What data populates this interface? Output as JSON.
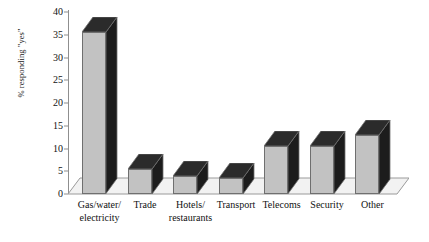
{
  "chart_data": {
    "type": "bar",
    "title": "",
    "subtitle": "",
    "xlabel": "",
    "ylabel": "% responding \"yes\"",
    "categories": [
      "Gas/water/ electricity",
      "Trade",
      "Hotels/ restaurants",
      "Transport",
      "Telecoms",
      "Security",
      "Other"
    ],
    "category_lines": [
      [
        "Gas/water/",
        "electricity"
      ],
      [
        "Trade"
      ],
      [
        "Hotels/",
        "restaurants"
      ],
      [
        "Transport"
      ],
      [
        "Telecoms"
      ],
      [
        "Security"
      ],
      [
        "Other"
      ]
    ],
    "values": [
      35.5,
      5.5,
      4,
      3.5,
      10.5,
      10.5,
      13
    ],
    "ylim": [
      0,
      40
    ],
    "yticks": [
      0,
      5,
      10,
      15,
      20,
      25,
      30,
      35,
      40
    ],
    "ytick_labels": [
      "0",
      "5",
      "10",
      "15",
      "20",
      "25",
      "30",
      "35",
      "40"
    ],
    "grid": false,
    "legend": null,
    "legend_position": "none",
    "style": "3d-column",
    "colors": {
      "bar_front": "#c2c2c2",
      "bar_side": "#1c1c1c",
      "bar_top": "#2b2b2b",
      "bar_outline": "#6f6f6f",
      "axis": "#8f8f8f",
      "floor": "#f2f2f2",
      "text": "#111111"
    }
  }
}
